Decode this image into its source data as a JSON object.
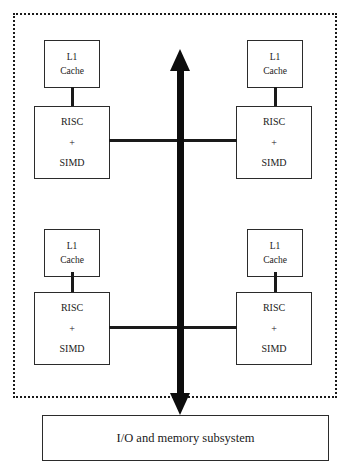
{
  "diagram": {
    "chip_boundary": {
      "style": "dotted",
      "label": ""
    },
    "clusters": [
      {
        "id": "upper-left",
        "cache": {
          "line1": "L1",
          "line2": "Cache"
        },
        "core": {
          "line1": "RISC",
          "line2": "+",
          "line3": "SIMD"
        }
      },
      {
        "id": "upper-right",
        "cache": {
          "line1": "L1",
          "line2": "Cache"
        },
        "core": {
          "line1": "RISC",
          "line2": "+",
          "line3": "SIMD"
        }
      },
      {
        "id": "lower-left",
        "cache": {
          "line1": "L1",
          "line2": "Cache"
        },
        "core": {
          "line1": "RISC",
          "line2": "+",
          "line3": "SIMD"
        }
      },
      {
        "id": "lower-right",
        "cache": {
          "line1": "L1",
          "line2": "Cache"
        },
        "core": {
          "line1": "RISC",
          "line2": "+",
          "line3": "SIMD"
        }
      }
    ],
    "bus": {
      "orientation": "vertical",
      "arrow": "bidirectional",
      "color": "#0d0d0d"
    },
    "subsystem": {
      "label": "I/O and memory subsystem"
    },
    "colors": {
      "stroke": "#2b2b2b",
      "bus": "#0d0d0d",
      "background": "#ffffff",
      "text": "#1a1a1a"
    }
  }
}
